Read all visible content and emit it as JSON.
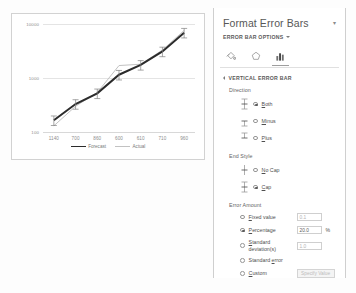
{
  "chart_data": {
    "type": "line",
    "title": "",
    "xlabel": "",
    "ylabel": "",
    "yscale": "log",
    "ylim": [
      100,
      10000
    ],
    "yticks": [
      "100",
      "1000",
      "10000"
    ],
    "categories": [
      "1140",
      "700",
      "860",
      "600",
      "610",
      "710",
      "960"
    ],
    "grid": true,
    "legend_position": "bottom",
    "error_bars": {
      "direction": "both",
      "end_style": "cap",
      "amount_type": "percentage",
      "percentage": 20.0
    },
    "series": [
      {
        "name": "Forecast",
        "color": "#2b2b2b",
        "values": [
          165,
          330,
          520,
          1150,
          1750,
          3100,
          6900
        ]
      },
      {
        "name": "Actual",
        "color": "#c2c2c2",
        "values": [
          130,
          300,
          540,
          1700,
          1800,
          3300,
          7600
        ]
      }
    ]
  },
  "pane": {
    "title": "Format Error Bars",
    "close_label": "▾",
    "options_header": "ERROR BAR OPTIONS",
    "icons": [
      {
        "name": "fill-bucket-icon",
        "label": "Fill & Line",
        "selected": false
      },
      {
        "name": "effects-pentagon-icon",
        "label": "Effects",
        "selected": false
      },
      {
        "name": "error-bar-options-icon",
        "label": "Error Bar Options",
        "selected": true
      }
    ],
    "section_header": "VERTICAL ERROR BAR",
    "direction": {
      "label": "Direction",
      "options": [
        {
          "label_pre": "",
          "accel": "B",
          "label_post": "oth",
          "checked": true,
          "glyph": "both"
        },
        {
          "label_pre": "",
          "accel": "M",
          "label_post": "inus",
          "checked": false,
          "glyph": "minus"
        },
        {
          "label_pre": "",
          "accel": "P",
          "label_post": "lus",
          "checked": false,
          "glyph": "plus"
        }
      ]
    },
    "end_style": {
      "label": "End Style",
      "options": [
        {
          "label_pre": "",
          "accel": "N",
          "label_post": "o Cap",
          "checked": false,
          "glyph": "nocap"
        },
        {
          "label_pre": "",
          "accel": "C",
          "label_post": "ap",
          "checked": true,
          "glyph": "cap"
        }
      ]
    },
    "error_amount": {
      "label": "Error Amount",
      "options": [
        {
          "accel": "F",
          "label_pre": "",
          "label_post": "ixed value",
          "checked": false,
          "input_value": "0.1",
          "input_disabled": true,
          "suffix": ""
        },
        {
          "accel": "P",
          "label_pre": "",
          "label_post": "ercentage",
          "checked": true,
          "input_value": "20.0",
          "input_disabled": false,
          "suffix": "%"
        },
        {
          "accel": "S",
          "label_pre": "",
          "label_post": "tandard deviation(s)",
          "checked": false,
          "input_value": "1.0",
          "input_disabled": true,
          "suffix": ""
        },
        {
          "accel": "E",
          "label_pre": "Standard ",
          "label_post": "rror",
          "checked": false,
          "input_value": null,
          "input_disabled": true,
          "suffix": ""
        },
        {
          "accel": "C",
          "label_pre": "",
          "label_post": "ustom",
          "checked": false,
          "input_value": null,
          "input_disabled": true,
          "suffix": ""
        }
      ],
      "specify_button": "Specify Value"
    }
  }
}
